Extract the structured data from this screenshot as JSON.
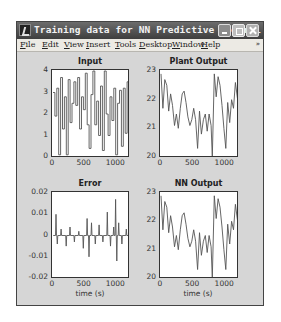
{
  "window": {
    "title": "Training data for NN Predictive Control",
    "buttons": [
      "minimize",
      "maximize",
      "close"
    ]
  },
  "menubar": {
    "items": [
      "File",
      "Edit",
      "View",
      "Insert",
      "Tools",
      "Desktop",
      "Window",
      "Help"
    ],
    "overflow": "»"
  },
  "chart_data": [
    {
      "type": "line",
      "title": "Input",
      "xlabel": "",
      "ylabel": "",
      "xlim": [
        0,
        1200
      ],
      "ylim": [
        0,
        4
      ],
      "xticks": [
        "0",
        "500",
        "1000"
      ],
      "yticks": [
        "0",
        "1",
        "2",
        "3",
        "4"
      ],
      "grid": false,
      "description": "Piecewise-constant random steps between 0 and 4",
      "x": [
        0,
        30,
        60,
        90,
        120,
        150,
        180,
        210,
        240,
        270,
        300,
        330,
        360,
        390,
        420,
        450,
        480,
        510,
        540,
        570,
        600,
        630,
        660,
        690,
        720,
        750,
        780,
        810,
        840,
        870,
        900,
        930,
        960,
        990,
        1020,
        1050,
        1080,
        1110,
        1140,
        1170,
        1200
      ],
      "values": [
        3.0,
        1.9,
        3.2,
        0.1,
        3.7,
        1.3,
        2.8,
        0.1,
        3.6,
        1.6,
        2.5,
        3.5,
        2.4,
        3.7,
        1.3,
        2.8,
        2.2,
        3.9,
        1.5,
        0.4,
        2.9,
        4.0,
        1.5,
        2.6,
        1.0,
        3.3,
        0.3,
        4.0,
        2.0,
        1.0,
        2.8,
        1.7,
        3.2,
        0.1,
        2.5,
        3.1,
        0.5,
        3.2,
        1.1,
        3.5,
        2.4
      ]
    },
    {
      "type": "line",
      "title": "Plant Output",
      "xlabel": "",
      "ylabel": "",
      "xlim": [
        0,
        1200
      ],
      "ylim": [
        20,
        23
      ],
      "xticks": [
        "0",
        "500",
        "1000"
      ],
      "yticks": [
        "20",
        "21",
        "22",
        "23"
      ],
      "grid": false,
      "x": [
        0,
        30,
        60,
        90,
        120,
        150,
        180,
        210,
        240,
        270,
        300,
        330,
        360,
        390,
        420,
        450,
        480,
        510,
        540,
        570,
        600,
        630,
        660,
        690,
        720,
        750,
        780,
        800,
        830,
        860,
        890,
        920,
        950,
        980,
        1010,
        1040,
        1070,
        1100,
        1130,
        1160,
        1200
      ],
      "values": [
        22.9,
        21.7,
        22.7,
        22.5,
        21.6,
        22.2,
        21.8,
        21.1,
        21.5,
        21.0,
        21.7,
        22.2,
        22.3,
        21.9,
        21.4,
        21.1,
        21.3,
        21.7,
        21.3,
        20.3,
        21.6,
        20.8,
        21.3,
        21.5,
        20.9,
        21.5,
        21.1,
        20.0,
        22.9,
        22.1,
        22.8,
        22.5,
        21.8,
        21.0,
        20.3,
        21.9,
        21.2,
        22.0,
        21.7,
        22.6,
        21.9
      ]
    },
    {
      "type": "line",
      "title": "Error",
      "xlabel": "time (s)",
      "ylabel": "",
      "xlim": [
        0,
        1200
      ],
      "ylim": [
        -0.02,
        0.02
      ],
      "xticks": [
        "0",
        "500",
        "1000"
      ],
      "yticks": [
        "-0.02",
        "-0.01",
        "0",
        "0.01",
        "0.02"
      ],
      "grid": false,
      "description": "Spiky noise around zero, mostly within ±0.005, peaks ≈ +0.017 near t=1000 and ≈ -0.012",
      "x": [
        0,
        40,
        60,
        120,
        200,
        260,
        330,
        400,
        470,
        530,
        560,
        600,
        660,
        720,
        780,
        850,
        900,
        950,
        980,
        1000,
        1030,
        1080,
        1150,
        1200
      ],
      "values": [
        0.0,
        0.01,
        -0.004,
        0.003,
        -0.005,
        0.004,
        -0.003,
        0.002,
        -0.006,
        0.008,
        -0.01,
        0.006,
        -0.004,
        0.005,
        -0.003,
        0.011,
        -0.005,
        0.004,
        0.017,
        -0.012,
        0.006,
        -0.004,
        0.003,
        0.0
      ]
    },
    {
      "type": "line",
      "title": "NN Output",
      "xlabel": "time (s)",
      "ylabel": "",
      "xlim": [
        0,
        1200
      ],
      "ylim": [
        20,
        23
      ],
      "xticks": [
        "0",
        "500",
        "1000"
      ],
      "yticks": [
        "20",
        "21",
        "22",
        "23"
      ],
      "grid": false,
      "x": [
        0,
        30,
        60,
        90,
        120,
        150,
        180,
        210,
        240,
        270,
        300,
        330,
        360,
        390,
        420,
        450,
        480,
        510,
        540,
        570,
        600,
        630,
        660,
        690,
        720,
        750,
        780,
        800,
        830,
        860,
        890,
        920,
        950,
        980,
        1010,
        1040,
        1070,
        1100,
        1130,
        1160,
        1200
      ],
      "values": [
        22.9,
        21.7,
        22.7,
        22.5,
        21.6,
        22.2,
        21.8,
        21.1,
        21.5,
        21.0,
        21.7,
        22.2,
        22.3,
        21.9,
        21.4,
        21.1,
        21.3,
        21.7,
        21.3,
        20.3,
        21.6,
        20.8,
        21.3,
        21.5,
        20.9,
        21.5,
        21.1,
        20.0,
        22.9,
        22.1,
        22.8,
        22.5,
        21.8,
        21.0,
        20.3,
        21.9,
        21.2,
        22.0,
        21.7,
        22.6,
        21.9
      ]
    }
  ]
}
